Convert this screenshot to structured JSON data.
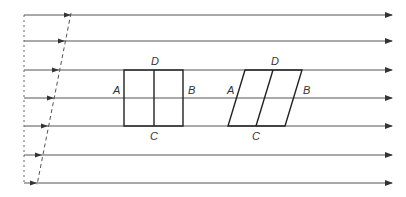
{
  "diagram": {
    "colors": {
      "line": "#444444",
      "background": "#ffffff"
    },
    "streamlines": {
      "count": 7,
      "y": [
        15,
        41,
        70,
        98,
        126,
        155,
        183
      ],
      "x_start": 24,
      "x_end": 392,
      "arrow_icon": "arrow-right-icon"
    },
    "velocity_profile": {
      "dashed_reference_x": 24,
      "dashed_profile_top": [
        70,
        15
      ],
      "dashed_profile_bottom": [
        38,
        183
      ]
    },
    "square": {
      "labels": {
        "top": "D",
        "bottom": "C",
        "left": "A",
        "right": "B"
      }
    },
    "parallelogram": {
      "labels": {
        "top": "D",
        "bottom": "C",
        "left": "A",
        "right": "B"
      }
    }
  }
}
